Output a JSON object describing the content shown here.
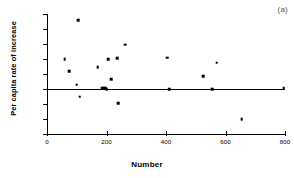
{
  "chart_data": {
    "type": "scatter",
    "title": "",
    "panel_label": "(a)",
    "xlabel": "Number",
    "ylabel": "Per capita rate of increase",
    "xlim": [
      0,
      800
    ],
    "ylim": [
      -0.3,
      0.5
    ],
    "xticks": [
      0,
      200,
      400,
      600,
      800
    ],
    "xtick_labels": [
      "0",
      "200",
      "400",
      "600",
      "800"
    ],
    "yticks": [
      0.5,
      0.4,
      0.3,
      0.2,
      0.1,
      0.0,
      -0.1,
      -0.2,
      -0.3
    ],
    "ytick_labels": [
      "0.50",
      "0.40",
      "0.30",
      "0.20",
      "0.10",
      "0.00",
      "-0.10",
      "-0.20",
      "-0.30"
    ],
    "grid": false,
    "legend": null,
    "reference_lines": [
      {
        "name": "zero-line",
        "orientation": "horizontal",
        "y": 0.0,
        "x_start": 0,
        "x_end": 800
      }
    ],
    "series": [
      {
        "name": "Per capita rate of increase",
        "marker": "filled-square",
        "color": "#000000",
        "points": [
          {
            "x": 60,
            "y": 0.2
          },
          {
            "x": 75,
            "y": 0.12
          },
          {
            "x": 100,
            "y": 0.03
          },
          {
            "x": 105,
            "y": 0.46
          },
          {
            "x": 110,
            "y": -0.05
          },
          {
            "x": 170,
            "y": 0.145
          },
          {
            "x": 185,
            "y": 0.005
          },
          {
            "x": 190,
            "y": 0.005
          },
          {
            "x": 196,
            "y": 0.005
          },
          {
            "x": 200,
            "y": 0.0
          },
          {
            "x": 205,
            "y": 0.2
          },
          {
            "x": 215,
            "y": 0.065
          },
          {
            "x": 235,
            "y": 0.205
          },
          {
            "x": 240,
            "y": -0.095
          },
          {
            "x": 262,
            "y": 0.295
          },
          {
            "x": 405,
            "y": 0.21
          },
          {
            "x": 410,
            "y": 0.0
          },
          {
            "x": 525,
            "y": 0.085
          },
          {
            "x": 555,
            "y": 0.0
          },
          {
            "x": 570,
            "y": 0.175
          },
          {
            "x": 655,
            "y": -0.2
          },
          {
            "x": 795,
            "y": 0.005
          }
        ]
      }
    ]
  }
}
